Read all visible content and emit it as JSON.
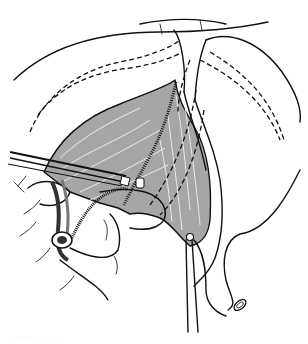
{
  "figure": {
    "type": "surgical anatomical line illustration",
    "colors": {
      "muscle_fill": "#a6a6a6",
      "line": "#111111",
      "background": "#ffffff"
    },
    "watermark": "·· ······ ···· ···"
  }
}
